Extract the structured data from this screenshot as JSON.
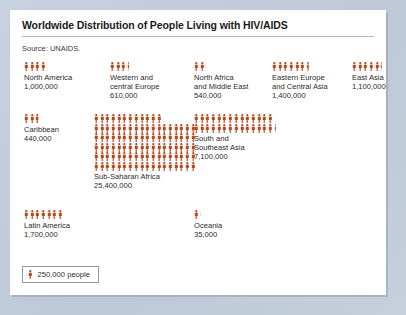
{
  "card": {
    "title": "Worldwide Distribution of People Living with HIV/AIDS",
    "source": "Source: UNAIDS."
  },
  "colors": {
    "icon": "#b5491f",
    "page_background": "#c3cedb",
    "card_background": "#ffffff",
    "text": "#2a2a2a",
    "rule": "#b9b9b9",
    "legend_border": "#9a9a9a"
  },
  "legend": {
    "icon_name": "person-icon",
    "text": "250,000 people",
    "unit_value": 250000
  },
  "chart_data": {
    "type": "pictogram",
    "title": "Worldwide Distribution of People Living with HIV/AIDS",
    "subtitle": "Source: UNAIDS.",
    "unit": 250000,
    "unit_label": "250,000 people",
    "categories": [
      "North America",
      "Western and central Europe",
      "North Africa and Middle East",
      "Eastern Europe and Central Asia",
      "East Asia",
      "Caribbean",
      "South and Southeast Asia",
      "Latin America",
      "Sub-Saharan Africa",
      "Oceania"
    ],
    "values": [
      1000000,
      610000,
      540000,
      1400000,
      1100000,
      440000,
      7100000,
      1700000,
      25400000,
      35000
    ],
    "value_labels": [
      "1,000,000",
      "610,000",
      "540,000",
      "1,400,000",
      "1,100,000",
      "440,000",
      "7,100,000",
      "1,700,000",
      "25,400,000",
      "35,000"
    ],
    "icon_counts": [
      4,
      2.44,
      2.16,
      5.6,
      4.4,
      1.76,
      28.4,
      6.8,
      101.6,
      0.14
    ]
  },
  "regions": [
    {
      "id": "north-america",
      "name_lines": [
        "North America"
      ],
      "value": "1,000,000",
      "icons": 4,
      "rows": [
        4
      ],
      "partial": 0
    },
    {
      "id": "western-central-europe",
      "name_lines": [
        "Western and",
        "central Europe"
      ],
      "value": "610,000",
      "icons": 3,
      "rows": [
        3
      ],
      "partial": 0.44
    },
    {
      "id": "north-africa-middle-east",
      "name_lines": [
        "North Africa",
        "and Middle East"
      ],
      "value": "540,000",
      "icons": 2,
      "rows": [
        2
      ],
      "partial": 0.16
    },
    {
      "id": "eastern-europe-central-asia",
      "name_lines": [
        "Eastern Europe",
        "and Central Asia"
      ],
      "value": "1,400,000",
      "icons": 6,
      "rows": [
        6
      ],
      "partial": 0.6
    },
    {
      "id": "east-asia",
      "name_lines": [
        "East Asia"
      ],
      "value": "1,100,000",
      "icons": 5,
      "rows": [
        5
      ],
      "partial": 0.4
    },
    {
      "id": "caribbean",
      "name_lines": [
        "Caribbean"
      ],
      "value": "440,000",
      "icons": 2,
      "rows": [
        2
      ],
      "partial": 0.76
    },
    {
      "id": "south-southeast-asia",
      "name_lines": [
        "South and",
        "Southeast Asia"
      ],
      "value": "7,100,000",
      "icons": 28,
      "rows": [
        14,
        14
      ],
      "partial": 0.4
    },
    {
      "id": "latin-america",
      "name_lines": [
        "Latin America"
      ],
      "value": "1,700,000",
      "icons": 7,
      "rows": [
        7
      ],
      "partial": 0
    },
    {
      "id": "sub-saharan-africa",
      "name_lines": [
        "Sub-Saharan Africa"
      ],
      "value": "25,400,000",
      "icons": 102,
      "rows": [
        12,
        18,
        18,
        18,
        18,
        18
      ],
      "partial": 0
    },
    {
      "id": "oceania",
      "name_lines": [
        "Oceania"
      ],
      "value": "35,000",
      "icons": 1,
      "rows": [
        1
      ],
      "partial": 0.14
    }
  ]
}
